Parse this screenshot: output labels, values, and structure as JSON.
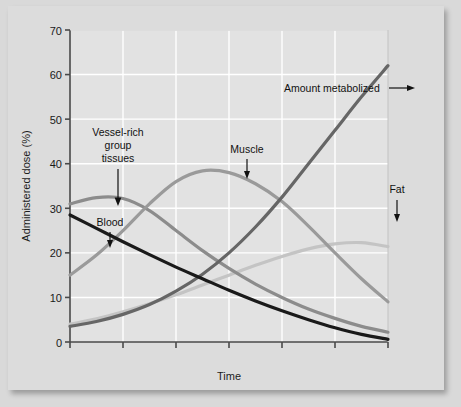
{
  "chart_data": {
    "type": "line",
    "title": "",
    "xlabel": "Time",
    "ylabel": "Administered dose (%)",
    "ylim": [
      0,
      70
    ],
    "yticks": [
      0,
      10,
      20,
      30,
      40,
      50,
      60,
      70
    ],
    "xlim": [
      0,
      6
    ],
    "xticks": [
      0,
      1,
      2,
      3,
      4,
      5
    ],
    "xticklabels": [
      "",
      "",
      "",
      "",
      "",
      ""
    ],
    "grid": true,
    "grid_color": "#ffffff",
    "plot_background": "#e2e2e2",
    "legend": "none (curves labeled inline with arrow annotations)",
    "series": [
      {
        "name": "Blood",
        "color": "#1a1a1a",
        "width": 3.2,
        "x": [
          0,
          0.5,
          1,
          1.5,
          2,
          2.5,
          3,
          3.5,
          4,
          4.5,
          5,
          5.5,
          6
        ],
        "values": [
          28.5,
          25.5,
          22.5,
          19.6,
          16.8,
          14.2,
          11.6,
          9.2,
          7.0,
          5.0,
          3.2,
          1.7,
          0.6
        ]
      },
      {
        "name": "Vessel-rich group tissues",
        "color": "#8c8c8c",
        "width": 3.2,
        "x": [
          0,
          0.5,
          1,
          1.5,
          2,
          2.5,
          3,
          3.5,
          4,
          4.5,
          5,
          5.5,
          6
        ],
        "values": [
          31.0,
          32.4,
          32.2,
          29.5,
          25.0,
          20.5,
          16.5,
          13.0,
          10.0,
          7.4,
          5.3,
          3.5,
          2.2
        ]
      },
      {
        "name": "Muscle",
        "color": "#9a9a9a",
        "width": 3.2,
        "x": [
          0,
          0.5,
          1,
          1.5,
          2,
          2.5,
          3,
          3.5,
          4,
          4.5,
          5,
          5.5,
          6
        ],
        "values": [
          15.0,
          19.5,
          25.0,
          31.0,
          36.0,
          38.4,
          38.0,
          35.5,
          31.5,
          26.0,
          20.0,
          14.2,
          9.0
        ]
      },
      {
        "name": "Fat",
        "color": "#c4c4c4",
        "width": 3.2,
        "x": [
          0,
          0.5,
          1,
          1.5,
          2,
          2.5,
          3,
          3.5,
          4,
          4.5,
          5,
          5.5,
          6
        ],
        "values": [
          4.0,
          5.2,
          6.8,
          8.6,
          10.6,
          12.8,
          15.0,
          17.2,
          19.2,
          20.9,
          22.0,
          22.3,
          21.4
        ]
      },
      {
        "name": "Amount metabolized",
        "color": "#666666",
        "width": 3.2,
        "x": [
          0,
          0.5,
          1,
          1.5,
          2,
          2.5,
          3,
          3.5,
          4,
          4.5,
          5,
          5.5,
          6
        ],
        "values": [
          3.5,
          4.6,
          6.2,
          8.4,
          11.4,
          15.2,
          20.0,
          25.8,
          32.5,
          40.0,
          47.5,
          55.0,
          62.0
        ]
      }
    ],
    "annotations": [
      {
        "label": "Vessel-rich group tissues",
        "lines": [
          "Vessel-rich",
          "group",
          "tissues"
        ],
        "arrow": "down"
      },
      {
        "label": "Blood",
        "lines": [
          "Blood"
        ],
        "arrow": "down"
      },
      {
        "label": "Muscle",
        "lines": [
          "Muscle"
        ],
        "arrow": "down"
      },
      {
        "label": "Fat",
        "lines": [
          "Fat"
        ],
        "arrow": "down"
      },
      {
        "label": "Amount metabolized",
        "lines": [
          "Amount metabolized"
        ],
        "arrow": "right"
      }
    ]
  },
  "axis": {
    "ylabel": "Administered dose (%)",
    "xlabel": "Time",
    "ytick_0": "0",
    "ytick_10": "10",
    "ytick_20": "20",
    "ytick_30": "30",
    "ytick_40": "40",
    "ytick_50": "50",
    "ytick_60": "60",
    "ytick_70": "70"
  },
  "annotations": {
    "vrg_line1": "Vessel-rich",
    "vrg_line2": "group",
    "vrg_line3": "tissues",
    "blood": "Blood",
    "muscle": "Muscle",
    "fat": "Fat",
    "metabolized": "Amount metabolized"
  }
}
